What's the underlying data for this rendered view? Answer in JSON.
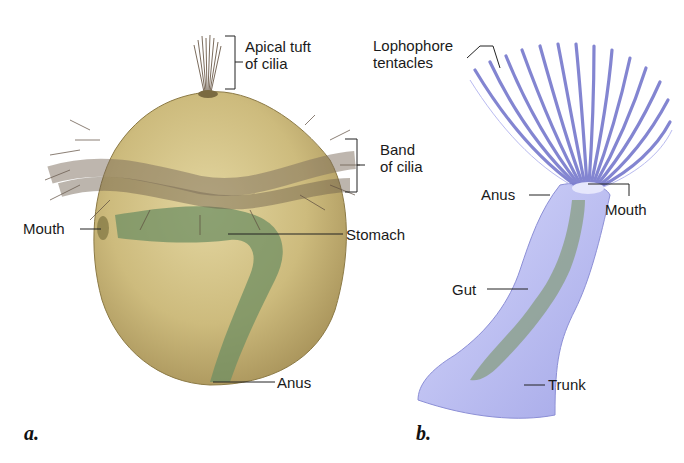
{
  "figure": {
    "panels": [
      {
        "id": "a",
        "letter": "a.",
        "subject": "trochophore-larva",
        "labels": {
          "apical_tuft_1": "Apical tuft",
          "apical_tuft_2": "of cilia",
          "band_1": "Band",
          "band_2": "of cilia",
          "mouth": "Mouth",
          "stomach": "Stomach",
          "anus": "Anus"
        }
      },
      {
        "id": "b",
        "letter": "b.",
        "subject": "lophophorate",
        "labels": {
          "lophophore_1": "Lophophore",
          "lophophore_2": "tentacles",
          "anus": "Anus",
          "mouth": "Mouth",
          "gut": "Gut",
          "trunk": "Trunk"
        }
      }
    ],
    "colors": {
      "body_a": "#c9b77a",
      "gut_a": "#6f8f63",
      "cilia": "#6b5a4a",
      "body_b": "#b7b9ee",
      "tentacle": "#7d7fcf",
      "gut_b": "#7f9a72",
      "leader": "#222222"
    }
  }
}
